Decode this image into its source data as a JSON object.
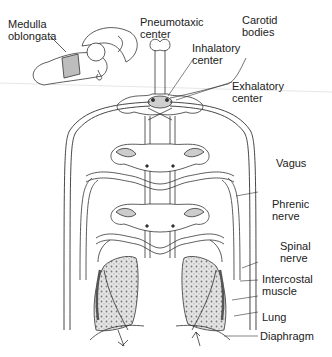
{
  "diagram": {
    "labels": {
      "medulla_oblongata": "Medulla\noblongata",
      "pneumotaxic_center": "Pneumotaxic\ncenter",
      "carotid_bodies": "Carotid\nbodies",
      "inhalatory_center": "Inhalatory\ncenter",
      "exhalatory_center": "Exhalatory\ncenter",
      "vagus": "Vagus",
      "phrenic_nerve": "Phrenic\nnerve",
      "spinal_nerve": "Spinal\nnerve",
      "intercostal_muscle": "Intercostal\nmuscle",
      "lung": "Lung",
      "diaphragm": "Diaphragm"
    },
    "colors": {
      "line": "#333333",
      "shade": "#bdbdbd",
      "lung_fill": "#d9d9d9",
      "background": "#ffffff"
    }
  }
}
